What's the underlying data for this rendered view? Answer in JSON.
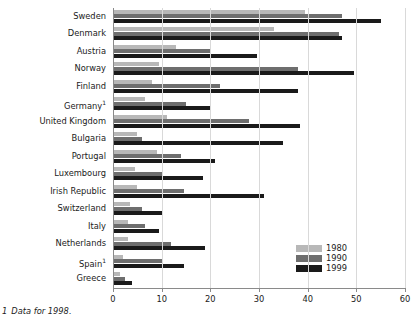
{
  "chart_data": {
    "type": "bar",
    "orientation": "horizontal",
    "title": "",
    "xlabel": "",
    "ylabel": "",
    "xlim": [
      0,
      60
    ],
    "xticks": [
      0,
      10,
      20,
      30,
      40,
      50,
      60
    ],
    "grid": true,
    "legend_position": "bottom-right",
    "categories": [
      "Sweden",
      "Denmark",
      "Austria",
      "Norway",
      "Finland",
      "Germany",
      "United Kingdom",
      "Bulgaria",
      "Portugal",
      "Luxembourg",
      "Irish Republic",
      "Switzerland",
      "Italy",
      "Netherlands",
      "Spain",
      "Greece"
    ],
    "category_footnote_marks": {
      "Germany": "1",
      "Spain": "1"
    },
    "series": [
      {
        "name": "1980",
        "color": "#b8b8b8",
        "values": [
          39.5,
          33.0,
          13.0,
          9.5,
          8.0,
          6.5,
          11.0,
          5.0,
          9.0,
          4.5,
          5.0,
          3.5,
          3.0,
          3.0,
          2.0,
          1.5
        ]
      },
      {
        "name": "1990",
        "color": "#6e6e6e",
        "values": [
          47.0,
          46.5,
          20.0,
          38.0,
          22.0,
          15.0,
          28.0,
          6.0,
          14.0,
          10.0,
          14.5,
          6.0,
          6.5,
          12.0,
          10.0,
          2.5
        ]
      },
      {
        "name": "1999",
        "color": "#1a1a1a",
        "values": [
          55.0,
          47.0,
          29.5,
          49.5,
          38.0,
          20.0,
          38.5,
          35.0,
          21.0,
          18.5,
          31.0,
          10.0,
          9.5,
          19.0,
          14.5,
          4.0
        ]
      }
    ]
  },
  "legend": {
    "items": [
      {
        "label": "1980",
        "color": "#b8b8b8"
      },
      {
        "label": "1990",
        "color": "#6e6e6e"
      },
      {
        "label": "1999",
        "color": "#1a1a1a"
      }
    ]
  },
  "footnote": {
    "marker": "1",
    "text": "Data for 1998."
  }
}
